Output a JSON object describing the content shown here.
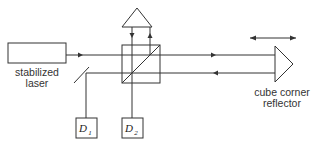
{
  "diagram": {
    "type": "interferometer-schematic",
    "colors": {
      "line": "#333333",
      "background": "#ffffff"
    },
    "components": {
      "laser": {
        "label_line1": "stabilized",
        "label_line2": "laser"
      },
      "beam_splitter_cube": {
        "label": ""
      },
      "reference_prism": {
        "label": ""
      },
      "pickoff_mirror": {
        "label": ""
      },
      "detector_1": {
        "label": "D",
        "subscript": "1"
      },
      "detector_2": {
        "label": "D",
        "subscript": "2"
      },
      "cube_corner": {
        "label_line1": "cube corner",
        "label_line2": "reflector"
      },
      "motion_arrow": {
        "meaning": "reflector translation"
      }
    }
  }
}
